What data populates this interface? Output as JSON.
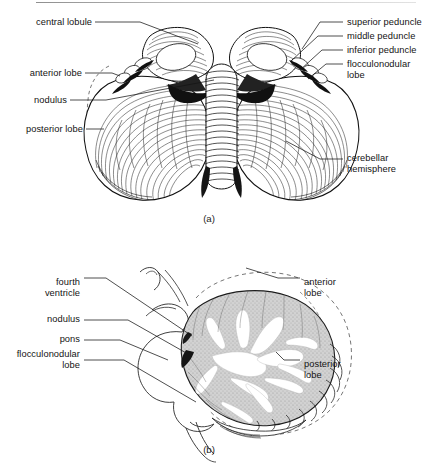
{
  "figure": {
    "ink_color": "#141414",
    "tissue_gray": "#c9c9c9",
    "panels": [
      {
        "caption": "(a)",
        "view": "posterior external view of cerebellum",
        "labels_left": [
          {
            "id": "central-lobule",
            "text": "central lobule"
          },
          {
            "id": "anterior-lobe",
            "text": "anterior lobe"
          },
          {
            "id": "nodulus",
            "text": "nodulus"
          },
          {
            "id": "posterior-lobe",
            "text": "posterior lobe"
          }
        ],
        "labels_right": [
          {
            "id": "superior-peduncle",
            "text": "superior peduncle"
          },
          {
            "id": "middle-peduncle",
            "text": "middle peduncle"
          },
          {
            "id": "inferior-peduncle",
            "text": "inferior peduncle"
          },
          {
            "id": "flocculonodular-lobe",
            "text": "flocculonodular\nlobe"
          },
          {
            "id": "cerebellar-hemisphere",
            "text": "cerebellar\nhemisphere"
          }
        ]
      },
      {
        "caption": "(b)",
        "view": "midsagittal section of cerebellum and brainstem",
        "labels_left": [
          {
            "id": "fourth-ventricle",
            "text": "fourth\nventricle"
          },
          {
            "id": "nodulus",
            "text": "nodulus"
          },
          {
            "id": "pons",
            "text": "pons"
          },
          {
            "id": "flocculonodular-lobe",
            "text": "flocculonodular\nlobe"
          }
        ],
        "labels_right": [
          {
            "id": "anterior-lobe",
            "text": "anterior\nlobe"
          },
          {
            "id": "posterior-lobe",
            "text": "posterior\nlobe"
          }
        ]
      }
    ]
  }
}
